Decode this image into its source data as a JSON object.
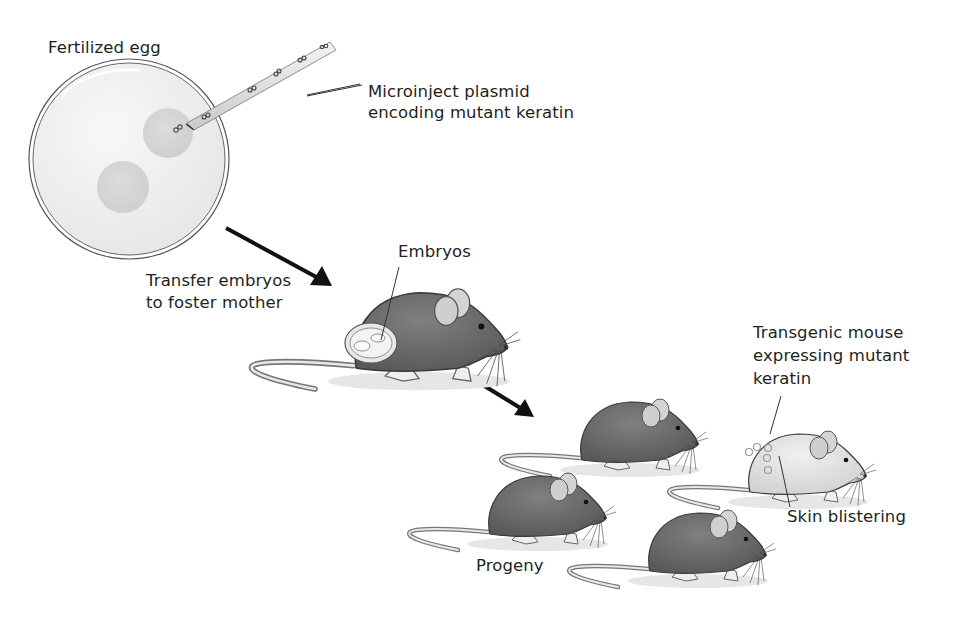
{
  "figure": {
    "type": "process-diagram"
  },
  "labels": {
    "fertilized_egg": "Fertilized egg",
    "microinject_line1": "Microinject plasmid",
    "microinject_line2": "encoding mutant keratin",
    "transfer_line1": "Transfer embryos",
    "transfer_line2": "to foster mother",
    "embryos": "Embryos",
    "transgenic_line1": "Transgenic mouse",
    "transgenic_line2": "expressing mutant",
    "transgenic_line3": "keratin",
    "skin_blistering": "Skin blistering",
    "progeny": "Progeny"
  },
  "steps": [
    {
      "id": "egg",
      "label": "Fertilized egg"
    },
    {
      "id": "injection",
      "label": "Microinject plasmid encoding mutant keratin"
    },
    {
      "id": "transfer",
      "label": "Transfer embryos to foster mother"
    },
    {
      "id": "progeny",
      "label": "Progeny"
    },
    {
      "id": "phenotype",
      "label": "Transgenic mouse expressing mutant keratin — Skin blistering"
    }
  ],
  "colors": {
    "mouse_fur": "#6e6e6e",
    "mouse_fur_light": "#e4e4e4",
    "egg_fill": "#efefef",
    "pronucleus": "#d6d6d6",
    "arrow": "#111111",
    "text": "#231f20"
  }
}
